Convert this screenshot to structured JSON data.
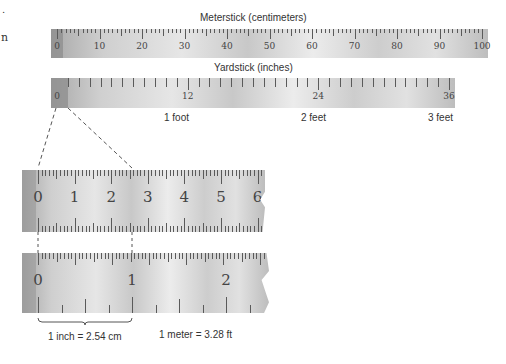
{
  "top_left_fragments": [
    ".",
    "n"
  ],
  "meterstick": {
    "title": "Meterstick (centimeters)",
    "labels": [
      "0",
      "10",
      "20",
      "30",
      "40",
      "50",
      "60",
      "70",
      "80",
      "90",
      "100"
    ]
  },
  "yardstick": {
    "title": "Yardstick (inches)",
    "labels": [
      "0",
      "12",
      "24",
      "36"
    ],
    "foot_labels": [
      "1 foot",
      "2 feet",
      "3 feet"
    ]
  },
  "zoom_centimeter": {
    "labels": [
      "0",
      "1",
      "2",
      "3",
      "4",
      "5",
      "6"
    ]
  },
  "zoom_inch": {
    "labels": [
      "0",
      "1",
      "2"
    ]
  },
  "annotations": {
    "inch_conversion": "1 inch = 2.54 cm",
    "meter_conversion": "1 meter = 3.28 ft"
  },
  "colors": {
    "ruler_light": "#e6e6e6",
    "ruler_dark": "#8e8e8e",
    "tick": "#5a5a5a",
    "text": "#333333"
  }
}
